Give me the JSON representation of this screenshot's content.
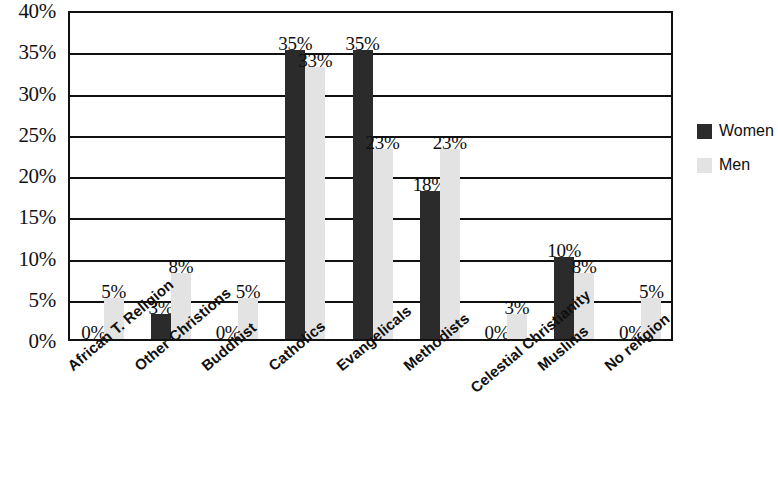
{
  "chart_data": {
    "type": "bar",
    "title": "",
    "xlabel": "",
    "ylabel": "",
    "ylim": [
      0,
      40
    ],
    "ytick_labels": [
      "40%",
      "35%",
      "30%",
      "25%",
      "20%",
      "15%",
      "10%",
      "5%",
      "0%"
    ],
    "yticks": [
      40,
      35,
      30,
      25,
      20,
      15,
      10,
      5,
      0
    ],
    "grid": true,
    "legend_position": "right",
    "categories": [
      "African T. Religion",
      "Other Christions",
      "Buddhist",
      "Catholics",
      "Evangelicals",
      "Methodists",
      "Celestial Christianity",
      "Muslims",
      "No religion"
    ],
    "series": [
      {
        "name": "Women",
        "color": "#2b2b2b",
        "values": [
          0,
          3,
          0,
          35,
          35,
          18,
          0,
          10,
          0
        ],
        "labels": [
          "0%",
          "3%",
          "0%",
          "35%",
          "35%",
          "18%",
          "0%",
          "10%",
          "0%"
        ]
      },
      {
        "name": "Men",
        "color": "#e3e3e3",
        "values": [
          5,
          8,
          5,
          33,
          23,
          23,
          3,
          8,
          5
        ],
        "labels": [
          "5%",
          "8%",
          "5%",
          "33%",
          "23%",
          "23%",
          "3%",
          "8%",
          "5%"
        ]
      }
    ]
  },
  "legend": {
    "items": [
      {
        "label": "Women",
        "swatch": "women"
      },
      {
        "label": "Men",
        "swatch": "men"
      }
    ]
  }
}
